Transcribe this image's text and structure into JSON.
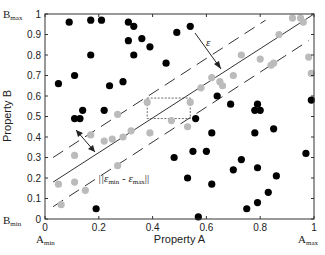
{
  "chart_data": {
    "type": "scatter",
    "title": "",
    "xlabel": "Property A",
    "ylabel": "Property B",
    "xlim": [
      0,
      1
    ],
    "ylim": [
      0,
      1
    ],
    "grid": false,
    "xticks": [
      "0",
      "0.2",
      "0.4",
      "0.6",
      "0.8",
      "1"
    ],
    "yticks": [
      "0",
      "0.1",
      "0.2",
      "0.3",
      "0.4",
      "0.5",
      "0.6",
      "0.7",
      "0.8",
      "0.9",
      "1"
    ],
    "corner_labels": {
      "b_max": {
        "base": "B",
        "sub": "max"
      },
      "b_min": {
        "base": "B",
        "sub": "min"
      },
      "a_min": {
        "base": "A",
        "sub": "min"
      },
      "a_max": {
        "base": "A",
        "sub": "max"
      }
    },
    "annotations": {
      "epsilon": "ε",
      "norm_label": "||ε",
      "norm_sub1": "min",
      "norm_mid": " - ε",
      "norm_sub2": "max",
      "norm_end": "||"
    },
    "lines": {
      "solid": {
        "x": [
          0.03,
          1.0
        ],
        "y": [
          0.18,
          1.0
        ]
      },
      "upper_dashed": {
        "x": [
          0.03,
          0.82
        ],
        "y": [
          0.3,
          0.97
        ]
      },
      "lower_dashed": {
        "x": [
          0.03,
          0.98
        ],
        "y": [
          0.06,
          0.87
        ]
      }
    },
    "rectangle": {
      "x0": 0.38,
      "x1": 0.54,
      "y0": 0.49,
      "y1": 0.59
    },
    "series": [
      {
        "name": "outside band",
        "color": "#000000",
        "points": [
          [
            0.05,
            0.66
          ],
          [
            0.09,
            0.96
          ],
          [
            0.11,
            0.7
          ],
          [
            0.17,
            0.8
          ],
          [
            0.24,
            0.65
          ],
          [
            0.29,
            0.67
          ],
          [
            0.31,
            0.96
          ],
          [
            0.31,
            0.87
          ],
          [
            0.33,
            0.8
          ],
          [
            0.33,
            0.94
          ],
          [
            0.45,
            0.76
          ],
          [
            0.14,
            0.53
          ],
          [
            0.22,
            0.53
          ],
          [
            0.11,
            0.49
          ],
          [
            0.13,
            0.49
          ],
          [
            0.48,
            0.3
          ],
          [
            0.19,
            0.05
          ],
          [
            0.17,
            0.97
          ],
          [
            0.21,
            0.97
          ],
          [
            0.36,
            0.88
          ],
          [
            0.39,
            0.84
          ],
          [
            0.49,
            0.91
          ],
          [
            0.54,
            0.94
          ],
          [
            0.64,
            0.6
          ],
          [
            0.69,
            0.56
          ],
          [
            0.79,
            0.56
          ],
          [
            0.78,
            0.53
          ],
          [
            0.8,
            0.53
          ],
          [
            0.99,
            0.58
          ],
          [
            0.56,
            0.49
          ],
          [
            0.85,
            0.44
          ],
          [
            0.62,
            0.42
          ],
          [
            0.78,
            0.42
          ],
          [
            0.55,
            0.33
          ],
          [
            0.6,
            0.33
          ],
          [
            0.73,
            0.29
          ],
          [
            0.97,
            0.32
          ],
          [
            0.79,
            0.25
          ],
          [
            0.7,
            0.24
          ],
          [
            0.86,
            0.21
          ],
          [
            0.53,
            0.2
          ],
          [
            0.62,
            0.17
          ],
          [
            0.79,
            0.08
          ],
          [
            0.83,
            0.13
          ],
          [
            0.57,
            0.01
          ],
          [
            0.75,
            0.05
          ]
        ]
      },
      {
        "name": "inside band",
        "color": "#bbbbbb",
        "points": [
          [
            0.05,
            0.17
          ],
          [
            0.06,
            0.07
          ],
          [
            0.11,
            0.18
          ],
          [
            0.15,
            0.14
          ],
          [
            0.11,
            0.31
          ],
          [
            0.17,
            0.41
          ],
          [
            0.22,
            0.38
          ],
          [
            0.25,
            0.39
          ],
          [
            0.27,
            0.26
          ],
          [
            0.29,
            0.4
          ],
          [
            0.32,
            0.43
          ],
          [
            0.27,
            0.51
          ],
          [
            0.38,
            0.57
          ],
          [
            0.39,
            0.42
          ],
          [
            0.47,
            0.48
          ],
          [
            0.53,
            0.45
          ],
          [
            0.54,
            0.57
          ],
          [
            0.58,
            0.64
          ],
          [
            0.62,
            0.69
          ],
          [
            0.65,
            0.67
          ],
          [
            0.66,
            0.65
          ],
          [
            0.7,
            0.7
          ],
          [
            0.73,
            0.8
          ],
          [
            0.8,
            0.78
          ],
          [
            0.84,
            0.75
          ],
          [
            0.85,
            0.76
          ],
          [
            0.87,
            0.9
          ],
          [
            0.92,
            0.98
          ],
          [
            0.95,
            0.98
          ],
          [
            0.96,
            0.96
          ],
          [
            0.98,
            0.79
          ],
          [
            0.99,
            0.71
          ]
        ]
      }
    ]
  }
}
